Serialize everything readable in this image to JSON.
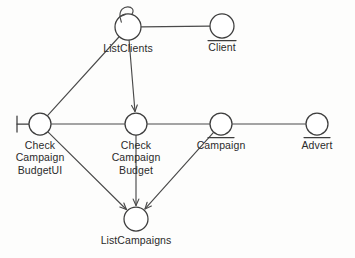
{
  "diagram": {
    "kind": "uml-robustness-diagram",
    "canvas": {
      "width": 355,
      "height": 258
    },
    "style": {
      "background": "#fdfdfc",
      "stroke": "#3d3d3d",
      "edge_stroke": "#4a4a4a",
      "node_fill": "#ffffff",
      "text_color": "#2b2b2b"
    },
    "nodes": [
      {
        "id": "listClients",
        "label": "ListClients",
        "stereotype": "control",
        "cx": 128,
        "cy": 27,
        "r": 13,
        "label_x": 93,
        "label_y": 42,
        "label_w": 70,
        "self_loop": true
      },
      {
        "id": "client",
        "label": "Client",
        "stereotype": "entity",
        "cx": 222,
        "cy": 26,
        "r": 12,
        "label_x": 192,
        "label_y": 41,
        "label_w": 60,
        "self_loop": false
      },
      {
        "id": "checkCampaignBudgetUI",
        "label": "Check\nCampaign\nBudgetUI",
        "stereotype": "boundary",
        "cx": 40,
        "cy": 124,
        "r": 11,
        "label_x": 3,
        "label_y": 139,
        "label_w": 74,
        "self_loop": false
      },
      {
        "id": "checkCampaignBudget",
        "label": "Check\nCampaign\nBudget",
        "stereotype": "control",
        "cx": 136,
        "cy": 124,
        "r": 11,
        "label_x": 99,
        "label_y": 139,
        "label_w": 74,
        "self_loop": false
      },
      {
        "id": "campaign",
        "label": "Campaign",
        "stereotype": "entity",
        "cx": 221,
        "cy": 124,
        "r": 11,
        "label_x": 185,
        "label_y": 139,
        "label_w": 72,
        "self_loop": false
      },
      {
        "id": "advert",
        "label": "Advert",
        "stereotype": "entity",
        "cx": 317,
        "cy": 124,
        "r": 11,
        "label_x": 287,
        "label_y": 139,
        "label_w": 60,
        "self_loop": false
      },
      {
        "id": "listCampaigns",
        "label": "ListCampaigns",
        "stereotype": "control",
        "cx": 136,
        "cy": 219,
        "r": 12,
        "label_x": 89,
        "label_y": 234,
        "label_w": 94,
        "self_loop": false
      }
    ],
    "edges": [
      {
        "id": "e-listClients-client",
        "from": "listClients",
        "to": "client",
        "arrow": false
      },
      {
        "id": "e-budgetUI-listClients",
        "from": "checkCampaignBudgetUI",
        "to": "listClients",
        "arrow": false
      },
      {
        "id": "e-listClients-checkBudget",
        "from": "listClients",
        "to": "checkCampaignBudget",
        "arrow": true
      },
      {
        "id": "e-budgetUI-checkBudget",
        "from": "checkCampaignBudgetUI",
        "to": "checkCampaignBudget",
        "arrow": false
      },
      {
        "id": "e-checkBudget-campaign",
        "from": "checkCampaignBudget",
        "to": "campaign",
        "arrow": false
      },
      {
        "id": "e-campaign-advert",
        "from": "campaign",
        "to": "advert",
        "arrow": false
      },
      {
        "id": "e-budgetUI-listCampaigns",
        "from": "checkCampaignBudgetUI",
        "to": "listCampaigns",
        "arrow": true
      },
      {
        "id": "e-checkBudget-listCampaigns",
        "from": "checkCampaignBudget",
        "to": "listCampaigns",
        "arrow": true
      },
      {
        "id": "e-campaign-listCampaigns",
        "from": "campaign",
        "to": "listCampaigns",
        "arrow": true
      }
    ]
  }
}
